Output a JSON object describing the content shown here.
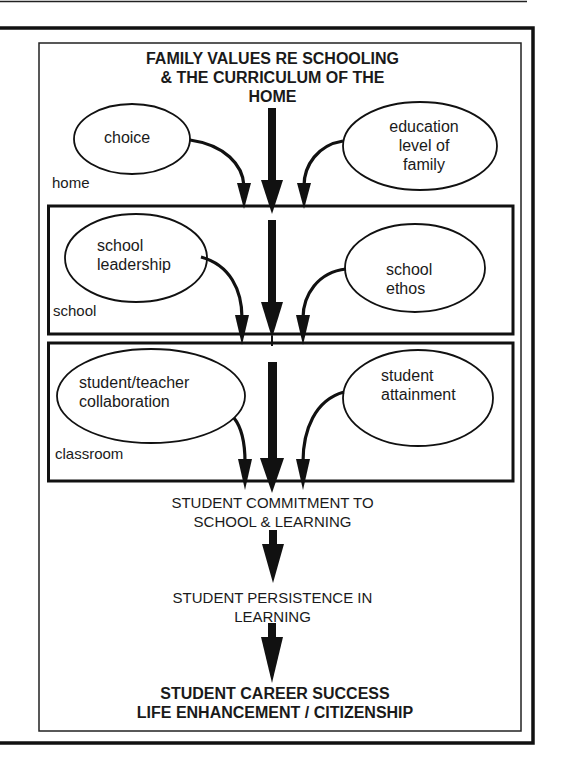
{
  "diagram": {
    "title": "FAMILY VALUES RE SCHOOLING & THE CURRICULUM OF THE HOME",
    "title_lines": [
      "FAMILY VALUES RE SCHOOLING",
      "& THE CURRICULUM OF THE",
      "HOME"
    ],
    "zones": [
      {
        "id": "home",
        "label": "home",
        "factors": [
          {
            "id": "choice",
            "label": "choice"
          },
          {
            "id": "education-level",
            "label": "education level of family",
            "lines": [
              "education",
              "level of",
              "family"
            ]
          }
        ]
      },
      {
        "id": "school",
        "label": "school",
        "factors": [
          {
            "id": "school-leadership",
            "label": "school leadership",
            "lines": [
              "school",
              "leadership"
            ]
          },
          {
            "id": "school-ethos",
            "label": "school ethos",
            "lines": [
              "school",
              "ethos"
            ]
          }
        ]
      },
      {
        "id": "classroom",
        "label": "classroom",
        "factors": [
          {
            "id": "student-teacher-collaboration",
            "label": "student/teacher collaboration",
            "lines": [
              "student/teacher",
              "collaboration"
            ]
          },
          {
            "id": "student-attainment",
            "label": "student attainment",
            "lines": [
              "student",
              "attainment"
            ]
          }
        ]
      }
    ],
    "outcomes": [
      {
        "id": "commitment",
        "lines": [
          "STUDENT COMMITMENT TO",
          "SCHOOL & LEARNING"
        ],
        "bold": false
      },
      {
        "id": "persistence",
        "lines": [
          "STUDENT PERSISTENCE IN",
          "LEARNING"
        ],
        "bold": false
      },
      {
        "id": "career",
        "lines": [
          "STUDENT CAREER SUCCESS",
          "LIFE ENHANCEMENT / CITIZENSHIP"
        ],
        "bold": true
      }
    ],
    "colors": {
      "ink": "#111111",
      "paper": "#ffffff"
    }
  }
}
